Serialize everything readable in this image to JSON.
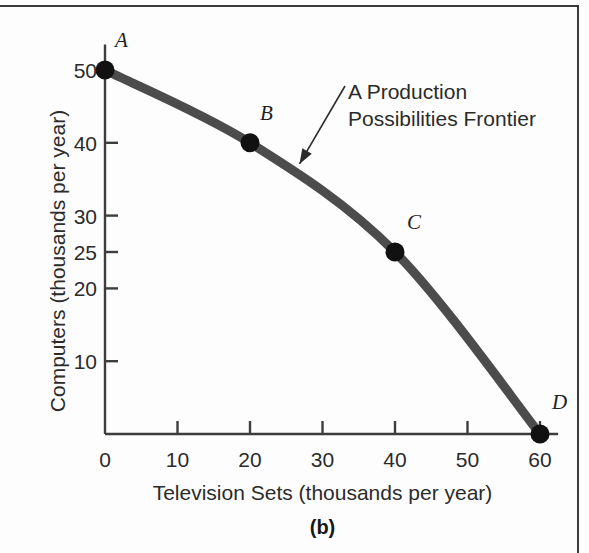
{
  "figure": {
    "panel_label": "(b)",
    "annotation": {
      "line1": "A Production",
      "line2": "Possibilities Frontier"
    },
    "curve_color": "#4c4c4c",
    "point_color": "#111111",
    "axis_color": "#3d3d3d",
    "text_color": "#2b2b2b"
  },
  "chart_data": {
    "type": "line",
    "title": "",
    "subtitle": "",
    "xlabel": "Television Sets (thousands per year)",
    "ylabel": "Computers (thousands per year)",
    "xlim": [
      0,
      63
    ],
    "ylim": [
      0,
      54
    ],
    "grid": false,
    "legend": "none",
    "xticks": [
      0,
      10,
      20,
      30,
      40,
      50,
      60
    ],
    "xticklabels": [
      "0",
      "10",
      "20",
      "30",
      "40",
      "50",
      "60"
    ],
    "yticks": [
      10,
      20,
      25,
      30,
      40,
      50
    ],
    "yticklabels": [
      "10",
      "20",
      "25",
      "30",
      "40",
      "50"
    ],
    "series": [
      {
        "name": "A Production Possibilities Frontier",
        "x": [
          0,
          20,
          40,
          60
        ],
        "y": [
          50,
          40,
          25,
          0
        ]
      }
    ],
    "points": [
      {
        "label": "A",
        "x": 0,
        "y": 50
      },
      {
        "label": "B",
        "x": 20,
        "y": 40
      },
      {
        "label": "C",
        "x": 40,
        "y": 25
      },
      {
        "label": "D",
        "x": 60,
        "y": 0
      }
    ],
    "annotations": [
      {
        "text": "A Production Possibilities Frontier",
        "target_x": 26,
        "target_y": 36
      }
    ]
  }
}
